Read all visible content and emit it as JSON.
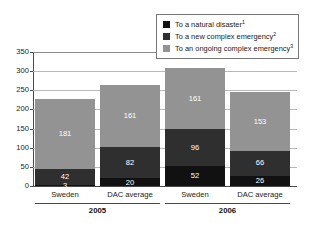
{
  "chart_data": {
    "type": "bar",
    "subtype": "stacked-bar-grouped",
    "title": "",
    "xlabel": "",
    "ylabel": "",
    "ylim": [
      0,
      350
    ],
    "yticks": [
      0,
      50,
      100,
      150,
      200,
      250,
      300,
      350
    ],
    "grid": true,
    "legend_position": "top-right",
    "categories": [
      "Sweden",
      "DAC average",
      "Sweden",
      "DAC average"
    ],
    "groups": [
      {
        "label": "2005",
        "categories": [
          "Sweden",
          "DAC average"
        ]
      },
      {
        "label": "2006",
        "categories": [
          "Sweden",
          "DAC average"
        ]
      }
    ],
    "series": [
      {
        "name": "To a natural disaster",
        "footnote": "1",
        "color": "#111111",
        "values": [
          3,
          20,
          52,
          26
        ]
      },
      {
        "name": "To a new complex emergency",
        "footnote": "2",
        "color": "#2f2f2f",
        "values": [
          42,
          82,
          96,
          66
        ]
      },
      {
        "name": "To an ongoing complex emergency",
        "footnote": "3",
        "color": "#939393",
        "values": [
          181,
          161,
          161,
          153
        ]
      }
    ],
    "bars": [
      {
        "category": "Sweden",
        "group": "2005",
        "total": 226,
        "segments": [
          {
            "series": "To a natural disaster",
            "value": 3
          },
          {
            "series": "To a new complex emergency",
            "value": 42
          },
          {
            "series": "To an ongoing complex emergency",
            "value": 181
          }
        ]
      },
      {
        "category": "DAC average",
        "group": "2005",
        "total": 263,
        "segments": [
          {
            "series": "To a natural disaster",
            "value": 20
          },
          {
            "series": "To a new complex emergency",
            "value": 82
          },
          {
            "series": "To an ongoing complex emergency",
            "value": 161
          }
        ]
      },
      {
        "category": "Sweden",
        "group": "2006",
        "total": 309,
        "segments": [
          {
            "series": "To a natural disaster",
            "value": 52
          },
          {
            "series": "To a new complex emergency",
            "value": 96
          },
          {
            "series": "To an ongoing complex emergency",
            "value": 161
          }
        ]
      },
      {
        "category": "DAC average",
        "group": "2006",
        "total": 245,
        "segments": [
          {
            "series": "To a natural disaster",
            "value": 26
          },
          {
            "series": "To a new complex emergency",
            "value": 66
          },
          {
            "series": "To an ongoing complex emergency",
            "value": 153
          }
        ]
      }
    ]
  },
  "legend": {
    "items": [
      {
        "label": "To a natural disaster",
        "footnote": "1",
        "color": "#111111"
      },
      {
        "label": "To a new complex emergency",
        "footnote": "2",
        "color": "#2f2f2f"
      },
      {
        "label": "To an ongoing complex emergency",
        "footnote": "3",
        "color": "#939393"
      }
    ]
  },
  "axis": {
    "y_tick_labels": [
      "350",
      "300",
      "250",
      "200",
      "150",
      "100",
      "50",
      "0"
    ]
  },
  "colors": {
    "natural_disaster": "#111111",
    "new_complex_emergency": "#2f2f2f",
    "ongoing_complex_emergency": "#939393",
    "gridline": "#b8b8b8",
    "axis": "#4a4a4a",
    "background": "#ffffff"
  }
}
